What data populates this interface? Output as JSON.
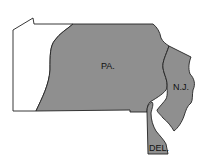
{
  "map": {
    "title": "",
    "colors": {
      "shaded": "#8f8f8f",
      "unshaded": "#ffffff",
      "outline": "#222222",
      "background": "#ffffff"
    },
    "regions": [
      {
        "id": "pa-west",
        "shaded": false
      },
      {
        "id": "pa",
        "label": "PA.",
        "shaded": true
      },
      {
        "id": "nj",
        "label": "N.J.",
        "shaded": true
      },
      {
        "id": "del",
        "label": "DEL.",
        "shaded": true
      }
    ]
  }
}
